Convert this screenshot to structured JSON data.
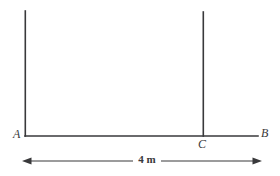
{
  "figure": {
    "type": "geometry-diagram",
    "background_color": "#ffffff",
    "stroke_color": "#39393b",
    "labels": {
      "left_base": "A",
      "mid_base": "C",
      "right_end": "B"
    },
    "dimension": {
      "value": "4 m",
      "from": "A",
      "to": "B"
    },
    "geometry": {
      "ground_line": {
        "x1": 25,
        "y1": 136,
        "x2": 258,
        "y2": 136
      },
      "left_post": {
        "x1": 25,
        "y1": 11,
        "x2": 25,
        "y2": 136
      },
      "right_post": {
        "x1": 203,
        "y1": 12,
        "x2": 203,
        "y2": 136
      },
      "dimension_line": {
        "x1": 22,
        "y1": 161,
        "x2": 262,
        "y2": 161
      }
    }
  }
}
